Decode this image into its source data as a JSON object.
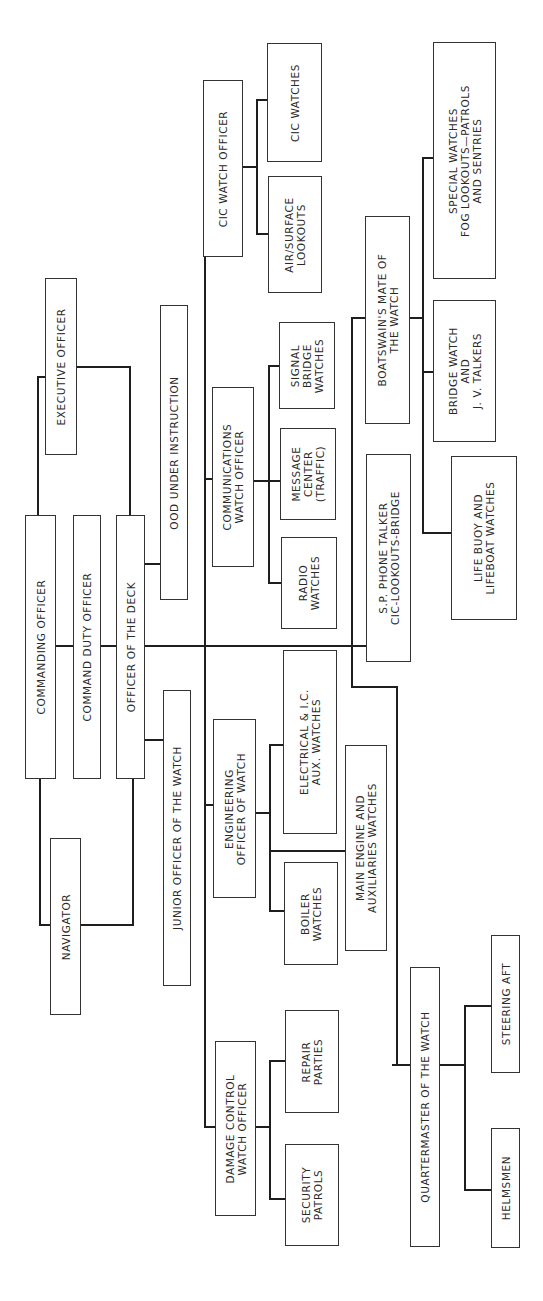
{
  "orientation": "rotated 90 degrees counter-clockwise",
  "colors": {
    "line": "#1e1e1e",
    "box_border": "#333333",
    "text": "#2a2a2a",
    "background": "#ffffff"
  },
  "nodes": {
    "commanding_officer": {
      "lines": [
        "COMMANDING OFFICER"
      ]
    },
    "command_duty_officer": {
      "lines": [
        "COMMAND DUTY OFFICER"
      ]
    },
    "officer_of_the_deck": {
      "lines": [
        "OFFICER OF THE DECK"
      ]
    },
    "executive_officer": {
      "lines": [
        "EXECUTIVE OFFICER"
      ]
    },
    "navigator": {
      "lines": [
        "NAVIGATOR"
      ]
    },
    "ood_under_instruction": {
      "lines": [
        "OOD UNDER INSTRUCTION"
      ]
    },
    "junior_officer_of_the_watch": {
      "lines": [
        "JUNIOR OFFICER OF THE WATCH"
      ]
    },
    "cic_watch_officer": {
      "lines": [
        "CIC WATCH OFFICER"
      ]
    },
    "cic_watches": {
      "lines": [
        "CIC WATCHES"
      ]
    },
    "air_surface_lookouts": {
      "lines": [
        "AIR/SURFACE",
        "LOOKOUTS"
      ]
    },
    "communications_watch_officer": {
      "lines": [
        "COMMUNICATIONS",
        "WATCH OFFICER"
      ]
    },
    "signal_bridge_watches": {
      "lines": [
        "SIGNAL",
        "BRIDGE",
        "WATCHES"
      ]
    },
    "message_center": {
      "lines": [
        "MESSAGE",
        "CENTER",
        "(TRAFFIC)"
      ]
    },
    "radio_watches": {
      "lines": [
        "RADIO",
        "WATCHES"
      ]
    },
    "sp_phone_talker": {
      "lines": [
        "S.P. PHONE TALKER",
        "CIC-LOOKOUTS-BRIDGE"
      ]
    },
    "boatswains_mate": {
      "lines": [
        "BOATSWAIN'S MATE OF",
        "THE WATCH"
      ]
    },
    "special_watches": {
      "lines": [
        "SPECIAL WATCHES",
        "FOG LOOKOUTS—PATROLS",
        "AND SENTRIES"
      ]
    },
    "bridge_watch": {
      "lines": [
        "BRIDGE WATCH",
        "AND",
        "J. V. TALKERS"
      ]
    },
    "life_buoy": {
      "lines": [
        "LIFE BUOY AND",
        "LIFEBOAT WATCHES"
      ]
    },
    "engineering_officer": {
      "lines": [
        "ENGINEERING",
        "OFFICER OF WATCH"
      ]
    },
    "electrical_ic": {
      "lines": [
        "ELECTRICAL & I.C.",
        "AUX. WATCHES"
      ]
    },
    "boiler_watches": {
      "lines": [
        "BOILER",
        "WATCHES"
      ]
    },
    "main_engine": {
      "lines": [
        "MAIN ENGINE AND",
        "AUXILIARIES WATCHES"
      ]
    },
    "damage_control": {
      "lines": [
        "DAMAGE CONTROL",
        "WATCH OFFICER"
      ]
    },
    "repair_parties": {
      "lines": [
        "REPAIR",
        "PARTIES"
      ]
    },
    "security_patrols": {
      "lines": [
        "SECURITY",
        "PATROLS"
      ]
    },
    "quartermaster": {
      "lines": [
        "QUARTERMASTER OF THE WATCH"
      ]
    },
    "helmsmen": {
      "lines": [
        "HELMSMEN"
      ]
    },
    "steering_aft": {
      "lines": [
        "STEERING AFT"
      ]
    }
  },
  "edges": [
    [
      "commanding_officer",
      "command_duty_officer"
    ],
    [
      "command_duty_officer",
      "officer_of_the_deck"
    ],
    [
      "commanding_officer",
      "executive_officer"
    ],
    [
      "officer_of_the_deck",
      "executive_officer"
    ],
    [
      "commanding_officer",
      "navigator"
    ],
    [
      "officer_of_the_deck",
      "navigator"
    ],
    [
      "officer_of_the_deck",
      "ood_under_instruction"
    ],
    [
      "officer_of_the_deck",
      "junior_officer_of_the_watch"
    ],
    [
      "officer_of_the_deck",
      "cic_watch_officer"
    ],
    [
      "officer_of_the_deck",
      "communications_watch_officer"
    ],
    [
      "officer_of_the_deck",
      "engineering_officer"
    ],
    [
      "officer_of_the_deck",
      "damage_control"
    ],
    [
      "officer_of_the_deck",
      "sp_phone_talker"
    ],
    [
      "officer_of_the_deck",
      "boatswains_mate"
    ],
    [
      "officer_of_the_deck",
      "quartermaster"
    ],
    [
      "cic_watch_officer",
      "cic_watches"
    ],
    [
      "cic_watch_officer",
      "air_surface_lookouts"
    ],
    [
      "communications_watch_officer",
      "signal_bridge_watches"
    ],
    [
      "communications_watch_officer",
      "message_center"
    ],
    [
      "communications_watch_officer",
      "radio_watches"
    ],
    [
      "boatswains_mate",
      "special_watches"
    ],
    [
      "boatswains_mate",
      "bridge_watch"
    ],
    [
      "boatswains_mate",
      "life_buoy"
    ],
    [
      "engineering_officer",
      "electrical_ic"
    ],
    [
      "engineering_officer",
      "main_engine"
    ],
    [
      "engineering_officer",
      "boiler_watches"
    ],
    [
      "damage_control",
      "repair_parties"
    ],
    [
      "damage_control",
      "security_patrols"
    ],
    [
      "quartermaster",
      "steering_aft"
    ],
    [
      "quartermaster",
      "helmsmen"
    ]
  ]
}
